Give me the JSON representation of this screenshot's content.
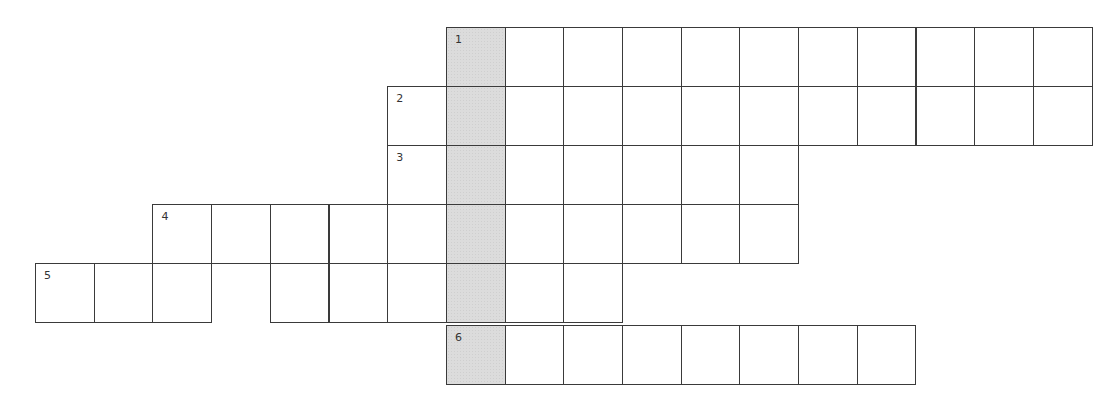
{
  "puzzle": {
    "type": "crossword",
    "cell_size": 58.7,
    "origin": {
      "x": 35,
      "y": 27
    },
    "shaded_column": 7,
    "shade_color": "#dcdcdc",
    "rows": [
      {
        "clue_number": "1",
        "row": 0,
        "cols": [
          7,
          8,
          9,
          10,
          11,
          12,
          13,
          14,
          15,
          16,
          17
        ],
        "number_col": 7
      },
      {
        "clue_number": "2",
        "row": 1,
        "cols": [
          6,
          7,
          8,
          9,
          10,
          11,
          12,
          13,
          14,
          15,
          16,
          17
        ],
        "number_col": 6
      },
      {
        "clue_number": "3",
        "row": 2,
        "cols": [
          6,
          7,
          8,
          9,
          10,
          11,
          12
        ],
        "number_col": 6
      },
      {
        "clue_number": "4",
        "row": 3,
        "cols": [
          2,
          3,
          4,
          5,
          6,
          7,
          8,
          9,
          10,
          11,
          12
        ],
        "number_col": 2
      },
      {
        "clue_number": "5",
        "row": 4,
        "cols": [
          0,
          1,
          2,
          4,
          5,
          6,
          7,
          8,
          9
        ],
        "number_col": 0
      },
      {
        "clue_number": "6",
        "row": 5,
        "cols": [
          7,
          8,
          9,
          10,
          11,
          12,
          13,
          14
        ],
        "number_col": 7,
        "y_offset": 3
      }
    ]
  }
}
